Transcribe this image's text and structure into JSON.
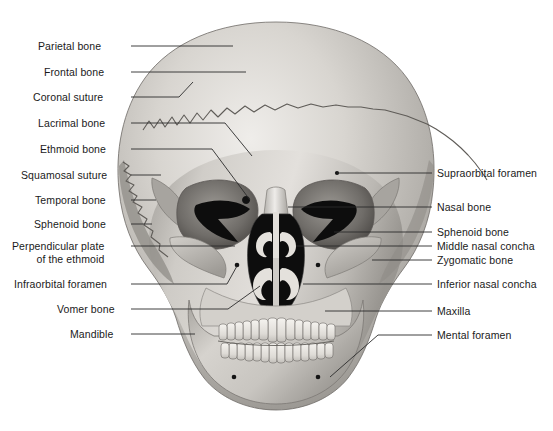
{
  "figure": {
    "background_color": "#ffffff",
    "text_color": "#1a1a1a",
    "leader_line_color": "#2b2b2b",
    "bone_light": "#e8e6e2",
    "bone_mid": "#b9b6b1",
    "bone_dark": "#8d8a85",
    "cavity_color": "#0d0d0d"
  },
  "labels_left": [
    {
      "text": "Parietal bone",
      "x": 38,
      "y": 40,
      "line": [
        [
          131,
          46
        ],
        [
          233,
          46
        ]
      ]
    },
    {
      "text": "Frontal bone",
      "x": 44,
      "y": 66,
      "line": [
        [
          131,
          72
        ],
        [
          246,
          72
        ]
      ]
    },
    {
      "text": "Coronal suture",
      "x": 33,
      "y": 91,
      "line": [
        [
          131,
          97
        ],
        [
          179,
          97
        ],
        [
          193,
          82
        ]
      ]
    },
    {
      "text": "Lacrimal bone",
      "x": 38,
      "y": 117,
      "line": [
        [
          131,
          123
        ],
        [
          225,
          123
        ],
        [
          252,
          156
        ]
      ]
    },
    {
      "text": "Ethmoid bone",
      "x": 40,
      "y": 143,
      "line": [
        [
          131,
          149
        ],
        [
          212,
          149
        ],
        [
          250,
          200
        ]
      ]
    },
    {
      "text": "Squamosal suture",
      "x": 21,
      "y": 169,
      "line": [
        [
          131,
          175
        ],
        [
          161,
          175
        ]
      ]
    },
    {
      "text": "Temporal bone",
      "x": 35,
      "y": 194,
      "line": [
        [
          131,
          200
        ],
        [
          156,
          200
        ]
      ]
    },
    {
      "text": "Sphenoid bone",
      "x": 34,
      "y": 218,
      "line": [
        [
          131,
          224
        ],
        [
          152,
          224
        ]
      ]
    },
    {
      "text": "Perpendicular plate",
      "x": 12,
      "y": 240,
      "line": [
        [
          131,
          246
        ],
        [
          235,
          246
        ]
      ],
      "text2": "of the ethmoid"
    },
    {
      "text": "Infraorbital foramen",
      "x": 14,
      "y": 278,
      "line": [
        [
          131,
          284
        ],
        [
          227,
          284
        ],
        [
          237,
          266
        ]
      ]
    },
    {
      "text": "Vomer bone",
      "x": 57,
      "y": 303,
      "line": [
        [
          131,
          309
        ],
        [
          228,
          309
        ],
        [
          260,
          286
        ]
      ]
    },
    {
      "text": "Mandible",
      "x": 70,
      "y": 328,
      "line": [
        [
          131,
          334
        ],
        [
          195,
          334
        ]
      ]
    }
  ],
  "labels_right": [
    {
      "text": "Supraorbital foramen",
      "x": 437,
      "y": 167,
      "line": [
        [
          432,
          173
        ],
        [
          337,
          173
        ]
      ]
    },
    {
      "text": "Nasal bone",
      "x": 437,
      "y": 201,
      "line": [
        [
          432,
          207
        ],
        [
          288,
          207
        ]
      ]
    },
    {
      "text": "Sphenoid bone",
      "x": 437,
      "y": 226,
      "line": [
        [
          432,
          232
        ],
        [
          334,
          232
        ]
      ]
    },
    {
      "text": "Middle nasal concha",
      "x": 437,
      "y": 240,
      "line": [
        [
          432,
          246
        ],
        [
          296,
          246
        ]
      ]
    },
    {
      "text": "Zygomatic bone",
      "x": 437,
      "y": 254,
      "line": [
        [
          432,
          260
        ],
        [
          372,
          260
        ]
      ]
    },
    {
      "text": "Inferior nasal concha",
      "x": 437,
      "y": 278,
      "line": [
        [
          432,
          284
        ],
        [
          303,
          284
        ]
      ]
    },
    {
      "text": "Maxilla",
      "x": 437,
      "y": 305,
      "line": [
        [
          432,
          311
        ],
        [
          325,
          311
        ]
      ]
    },
    {
      "text": "Mental foramen",
      "x": 437,
      "y": 329,
      "line": [
        [
          432,
          335
        ],
        [
          378,
          335
        ],
        [
          330,
          377
        ]
      ]
    }
  ]
}
